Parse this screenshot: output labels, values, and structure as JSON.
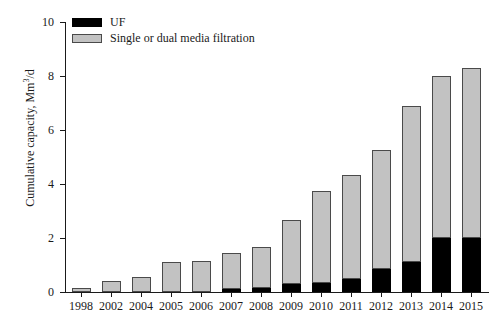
{
  "chart_data": {
    "type": "bar",
    "stacked": true,
    "title": "",
    "subtitle": "",
    "xlabel": "",
    "ylabel": "Cumulative capacity, Mm3/d",
    "ylabel_parts": {
      "prefix": "Cumulative capacity, Mm",
      "superscript": "3",
      "suffix": "/d"
    },
    "categories": [
      "1998",
      "2002",
      "2004",
      "2005",
      "2006",
      "2007",
      "2008",
      "2009",
      "2010",
      "2011",
      "2012",
      "2013",
      "2014",
      "2015"
    ],
    "series": [
      {
        "name": "UF",
        "color": "#000000",
        "values": [
          0.0,
          0.0,
          0.0,
          0.0,
          0.0,
          0.1,
          0.15,
          0.3,
          0.35,
          0.5,
          0.85,
          1.1,
          2.0,
          2.0
        ]
      },
      {
        "name": "Single or dual media filtration",
        "color": "#c2c2c2",
        "values": [
          0.15,
          0.4,
          0.55,
          1.1,
          1.15,
          1.35,
          1.5,
          2.35,
          3.4,
          3.85,
          4.4,
          5.8,
          6.0,
          6.3
        ]
      }
    ],
    "totals": [
      0.15,
      0.4,
      0.55,
      1.1,
      1.15,
      1.45,
      1.65,
      2.65,
      3.75,
      4.35,
      5.25,
      6.9,
      8.0,
      8.3
    ],
    "ylim": [
      0,
      10
    ],
    "yticks": [
      0,
      2,
      4,
      6,
      8,
      10
    ],
    "ytick_labels": [
      "0",
      "2",
      "4",
      "6",
      "8",
      "10"
    ],
    "grid": false,
    "legend_position": "top-left",
    "legend": [
      {
        "label": "UF",
        "color": "#000000"
      },
      {
        "label": "Single or dual media filtration",
        "color": "#c2c2c2"
      }
    ]
  }
}
